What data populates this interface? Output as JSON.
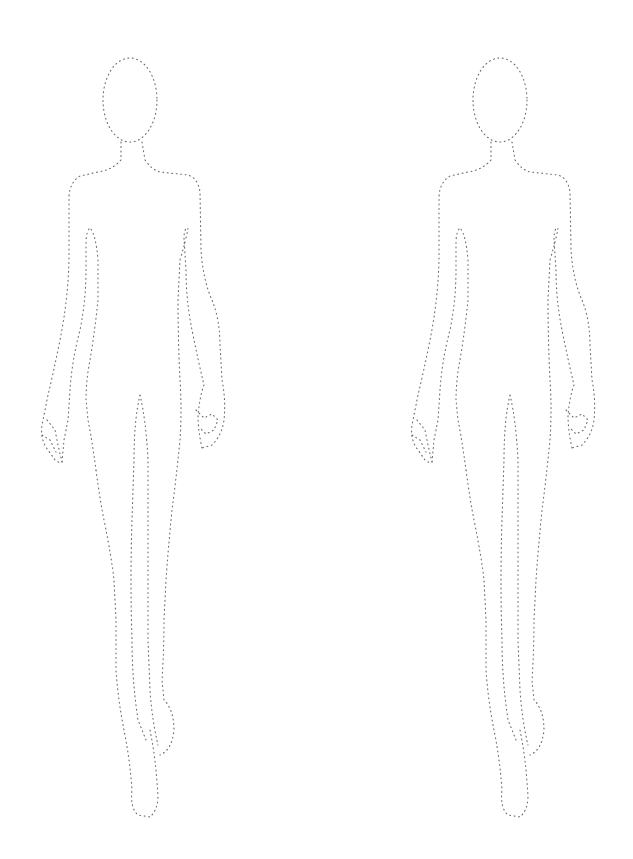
{
  "page": {
    "title": "Fashion croquis template",
    "background_color": "#ffffff",
    "outline_color": "#6a6a6a",
    "outline_style": "dotted"
  },
  "figures": [
    {
      "id": "figure-left",
      "label": "Female croquis figure (left)",
      "pose": "walking, front view"
    },
    {
      "id": "figure-right",
      "label": "Female croquis figure (right)",
      "pose": "walking, front view"
    }
  ]
}
